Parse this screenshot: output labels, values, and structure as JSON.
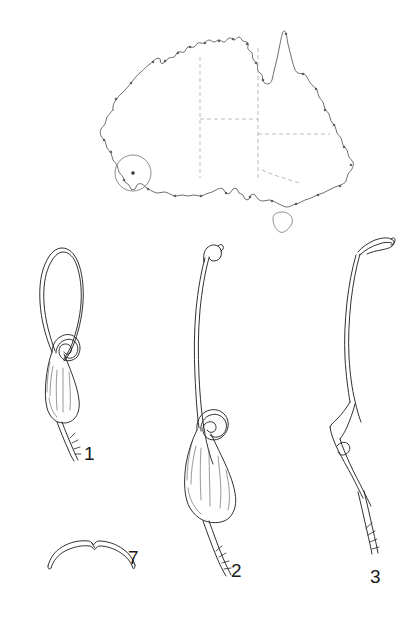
{
  "plate": {
    "width": 417,
    "height": 635,
    "background": "#ffffff",
    "ink_color": "#1a1a1a",
    "line_color": "#333333",
    "dashed_border_color": "#999999",
    "description": "Scientific botanical plate: distribution map of Australia above four numbered line-drawing specimens"
  },
  "map": {
    "name": "australia-distribution-map",
    "coastline_color": "#555555",
    "state_border_style": "dashed",
    "state_border_color": "#aaaaaa",
    "locality_marker": {
      "shape": "circle",
      "center_x": 133,
      "center_y": 173,
      "radius": 18,
      "stroke": "#777777",
      "dot_radius": 1.8,
      "dot_color": "#333333",
      "region": "south-west Western Australia"
    }
  },
  "figures": [
    {
      "id": "figure-1",
      "label": "1",
      "label_x": 84,
      "label_y": 444,
      "description": "elongated narrow loop above a coiled spiral and teardrop-shaped swollen base with bristled stalk"
    },
    {
      "id": "figure-2",
      "label": "2",
      "label_x": 231,
      "label_y": 561,
      "description": "long sinuous stem with hooked apex above a coiled spiral and broad swollen base with bristled stalk"
    },
    {
      "id": "figure-3",
      "label": "3",
      "label_x": 370,
      "label_y": 567,
      "description": "long curved slender stem with flattened hooked apex and narrow tapering base with bristled stalk"
    },
    {
      "id": "figure-7",
      "label": "7",
      "label_x": 128,
      "label_y": 548,
      "description": "small shallow crescent arc with central notch"
    }
  ]
}
